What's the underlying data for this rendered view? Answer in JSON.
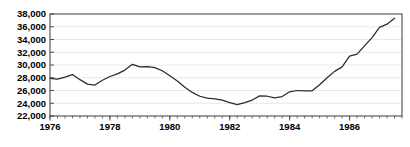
{
  "chart_data": {
    "type": "line",
    "title": "",
    "subtitle": "",
    "xlabel": "",
    "ylabel": "",
    "grid": true,
    "legend": false,
    "legend_position": "none",
    "xlim": [
      1976.0,
      1987.75
    ],
    "ylim": [
      22000,
      38000
    ],
    "ytick_labels": [
      "38,000",
      "36,000",
      "34,000",
      "32,000",
      "30,000",
      "28,000",
      "26,000",
      "24,000",
      "22,000"
    ],
    "ytick_values": [
      38000,
      36000,
      34000,
      32000,
      30000,
      28000,
      26000,
      24000,
      22000
    ],
    "xtick_labels": [
      "1976",
      "1978",
      "1980",
      "1982",
      "1984",
      "1986"
    ],
    "xtick_values": [
      1976,
      1978,
      1980,
      1982,
      1984,
      1986
    ],
    "xminor_step": 0.25,
    "series": [
      {
        "name": "series-1",
        "color": "#2b2b2b",
        "x": [
          1976.0,
          1976.25,
          1976.5,
          1976.75,
          1977.0,
          1977.25,
          1977.5,
          1977.75,
          1978.0,
          1978.25,
          1978.5,
          1978.75,
          1979.0,
          1979.25,
          1979.5,
          1979.75,
          1980.0,
          1980.25,
          1980.5,
          1980.75,
          1981.0,
          1981.25,
          1981.5,
          1981.75,
          1982.0,
          1982.25,
          1982.5,
          1982.75,
          1983.0,
          1983.25,
          1983.5,
          1983.75,
          1984.0,
          1984.25,
          1984.5,
          1984.75,
          1985.0,
          1985.25,
          1985.5,
          1985.75,
          1986.0,
          1986.25,
          1986.5,
          1986.75,
          1987.0,
          1987.25,
          1987.5
        ],
        "values": [
          27900,
          27800,
          28100,
          28500,
          27700,
          27000,
          26850,
          27600,
          28200,
          28600,
          29200,
          30100,
          29700,
          29750,
          29600,
          29100,
          28300,
          27500,
          26500,
          25700,
          25100,
          24800,
          24700,
          24500,
          24100,
          23800,
          24100,
          24500,
          25150,
          25100,
          24850,
          25050,
          25800,
          26000,
          25950,
          25950,
          26900,
          28000,
          29000,
          29700,
          31400,
          31700,
          33000,
          34300,
          35900,
          36400,
          37350
        ]
      }
    ]
  }
}
